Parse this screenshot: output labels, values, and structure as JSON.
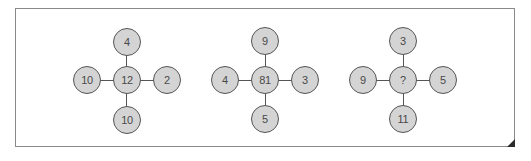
{
  "puzzle": {
    "description": "Number cross puzzle: each figure has a center value and four surrounding values",
    "colors": {
      "node_fill": "#d4d4d4",
      "node_border": "#555555",
      "text": "#4a4a4a",
      "frame_border": "#8a8a8a",
      "fold": "#2a2a2a"
    },
    "figures": [
      {
        "center": "12",
        "top": "4",
        "left": "10",
        "right": "2",
        "bottom": "10"
      },
      {
        "center": "81",
        "top": "9",
        "left": "4",
        "right": "3",
        "bottom": "5"
      },
      {
        "center": "?",
        "top": "3",
        "left": "9",
        "right": "5",
        "bottom": "11"
      }
    ]
  }
}
